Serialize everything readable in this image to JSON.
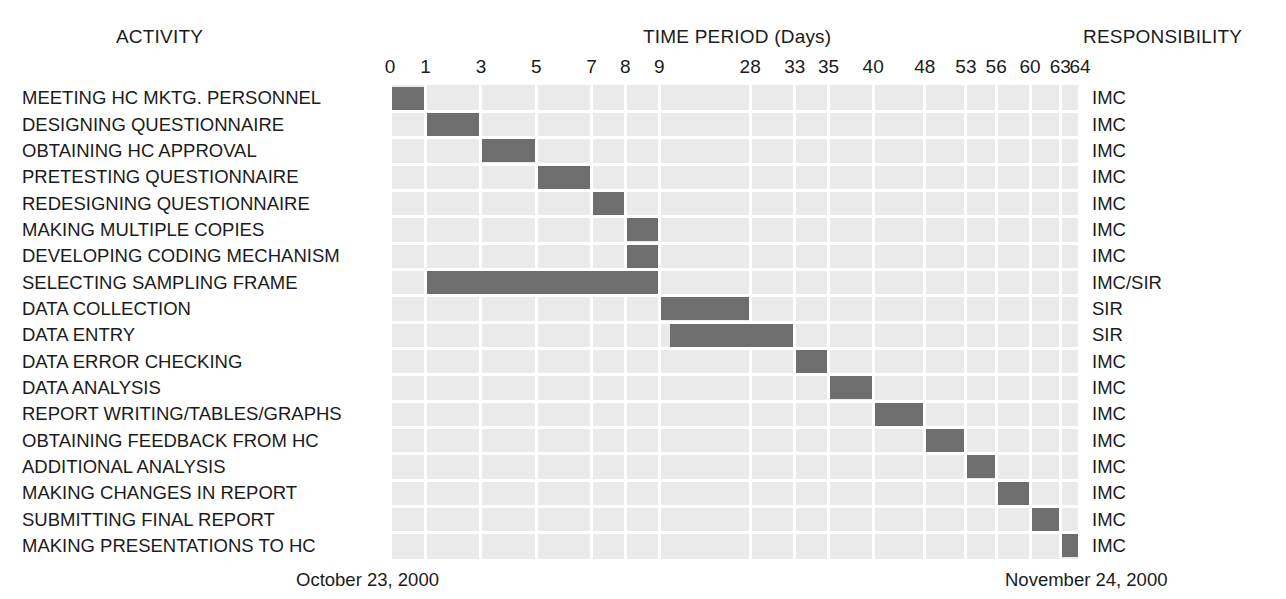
{
  "header": {
    "activity_label": "ACTIVITY",
    "time_label": "TIME PERIOD (Days)",
    "responsibility_label": "RESPONSIBILITY"
  },
  "footer": {
    "start_date": "October 23, 2000",
    "end_date": "November 24, 2000"
  },
  "chart_data": {
    "type": "bar",
    "title": "TIME PERIOD (Days)",
    "xlabel": "TIME PERIOD (Days)",
    "ylabel": "ACTIVITY",
    "orientation": "horizontal",
    "grid": true,
    "legend": "none",
    "xlim": [
      0,
      64
    ],
    "axis_ticks": [
      0,
      1,
      3,
      5,
      7,
      8,
      9,
      28,
      33,
      35,
      40,
      48,
      53,
      56,
      60,
      63,
      64
    ],
    "tick_labels": [
      "0",
      "1",
      "3",
      "5",
      "7",
      "8",
      "9",
      "28",
      "33",
      "35",
      "40",
      "48",
      "53",
      "56",
      "60",
      "63",
      "64"
    ],
    "categories": [
      "MEETING HC MKTG. PERSONNEL",
      "DESIGNING QUESTIONNAIRE",
      "OBTAINING HC APPROVAL",
      "PRETESTING QUESTIONNAIRE",
      "REDESIGNING QUESTIONNAIRE",
      "MAKING MULTIPLE COPIES",
      "DEVELOPING CODING MECHANISM",
      "SELECTING SAMPLING FRAME",
      "DATA COLLECTION",
      "DATA ENTRY",
      "DATA ERROR CHECKING",
      "DATA ANALYSIS",
      "REPORT WRITING/TABLES/GRAPHS",
      "OBTAINING FEEDBACK FROM HC",
      "ADDITIONAL ANALYSIS",
      "MAKING CHANGES IN REPORT",
      "SUBMITTING FINAL REPORT",
      "MAKING PRESENTATIONS TO HC"
    ],
    "responsibilities": [
      "IMC",
      "IMC",
      "IMC",
      "IMC",
      "IMC",
      "IMC",
      "IMC",
      "IMC/SIR",
      "SIR",
      "SIR",
      "IMC",
      "IMC",
      "IMC",
      "IMC",
      "IMC",
      "IMC",
      "IMC",
      "IMC"
    ],
    "tasks": [
      {
        "name": "MEETING HC MKTG. PERSONNEL",
        "start": 0,
        "end": 1,
        "duration": 1,
        "responsibility": "IMC"
      },
      {
        "name": "DESIGNING QUESTIONNAIRE",
        "start": 1,
        "end": 3,
        "duration": 2,
        "responsibility": "IMC"
      },
      {
        "name": "OBTAINING HC APPROVAL",
        "start": 3,
        "end": 5,
        "duration": 2,
        "responsibility": "IMC"
      },
      {
        "name": "PRETESTING QUESTIONNAIRE",
        "start": 5,
        "end": 7,
        "duration": 2,
        "responsibility": "IMC"
      },
      {
        "name": "REDESIGNING QUESTIONNAIRE",
        "start": 7,
        "end": 8,
        "duration": 1,
        "responsibility": "IMC"
      },
      {
        "name": "MAKING MULTIPLE COPIES",
        "start": 8,
        "end": 9,
        "duration": 1,
        "responsibility": "IMC"
      },
      {
        "name": "DEVELOPING CODING MECHANISM",
        "start": 8,
        "end": 9,
        "duration": 1,
        "responsibility": "IMC"
      },
      {
        "name": "SELECTING SAMPLING FRAME",
        "start": 1,
        "end": 9,
        "duration": 8,
        "responsibility": "IMC/SIR"
      },
      {
        "name": "DATA COLLECTION",
        "start": 9,
        "end": 28,
        "duration": 19,
        "responsibility": "SIR"
      },
      {
        "name": "DATA ENTRY",
        "start": 11,
        "end": 33,
        "duration": 22,
        "responsibility": "SIR"
      },
      {
        "name": "DATA ERROR CHECKING",
        "start": 33,
        "end": 35,
        "duration": 2,
        "responsibility": "IMC"
      },
      {
        "name": "DATA ANALYSIS",
        "start": 35,
        "end": 40,
        "duration": 5,
        "responsibility": "IMC"
      },
      {
        "name": "REPORT WRITING/TABLES/GRAPHS",
        "start": 40,
        "end": 48,
        "duration": 8,
        "responsibility": "IMC"
      },
      {
        "name": "OBTAINING FEEDBACK FROM HC",
        "start": 48,
        "end": 53,
        "duration": 5,
        "responsibility": "IMC"
      },
      {
        "name": "ADDITIONAL ANALYSIS",
        "start": 53,
        "end": 56,
        "duration": 3,
        "responsibility": "IMC"
      },
      {
        "name": "MAKING CHANGES IN REPORT",
        "start": 56,
        "end": 60,
        "duration": 4,
        "responsibility": "IMC"
      },
      {
        "name": "SUBMITTING FINAL REPORT",
        "start": 60,
        "end": 63,
        "duration": 3,
        "responsibility": "IMC"
      },
      {
        "name": "MAKING PRESENTATIONS TO HC",
        "start": 63,
        "end": 64,
        "duration": 1,
        "responsibility": "IMC"
      }
    ]
  },
  "colors": {
    "bar": "#6e6e6e",
    "grid_band": "#eaeaea",
    "grid_line": "#ffffff",
    "text": "#1b1b1b",
    "background": "#ffffff"
  }
}
